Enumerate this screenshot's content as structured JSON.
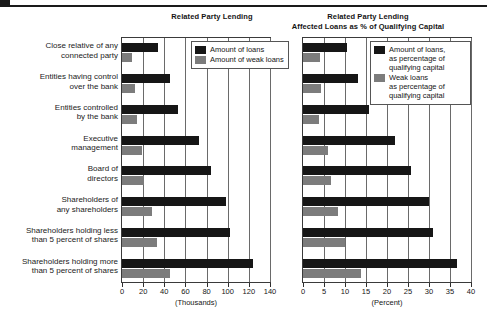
{
  "chart_data": [
    {
      "id": "left",
      "type": "bar",
      "orientation": "horizontal",
      "title": "Related Party Lending",
      "xlabel": "(Thousands)",
      "ylabel": "",
      "xlim": [
        0,
        140
      ],
      "xticks": [
        0,
        20,
        40,
        60,
        80,
        100,
        120,
        140
      ],
      "grid": true,
      "legend_position": "top-right",
      "categories": [
        "Close relative of any\nconnected party",
        "Entities having control\nover the bank",
        "Entities controlled\nby the bank",
        "Executive\nmanagement",
        "Board of\ndirectors",
        "Shareholders of\nany shareholders",
        "Shareholders holding less\nthan 5 percent of shares",
        "Shareholders holding more\nthan 5 percent of shares"
      ],
      "series": [
        {
          "name": "Amount of loans",
          "color": "#161616",
          "values": [
            34,
            45,
            53,
            73,
            84,
            98,
            102,
            124
          ]
        },
        {
          "name": "Amount of weak loans",
          "color": "#7c7c7c",
          "values": [
            9,
            12,
            14,
            19,
            21,
            28,
            33,
            45
          ]
        }
      ]
    },
    {
      "id": "right",
      "type": "bar",
      "orientation": "horizontal",
      "title": "Related Party Lending\nAffected  Loans as % of Qualifying Capital",
      "xlabel": "(Percent)",
      "ylabel": "",
      "xlim": [
        0,
        40
      ],
      "xticks": [
        0,
        5,
        10,
        15,
        20,
        25,
        30,
        35,
        40
      ],
      "grid": true,
      "legend_position": "top-right",
      "categories": [
        "Close relative of any connected party",
        "Entities having control over the bank",
        "Entities controlled by the bank",
        "Executive management",
        "Board of directors",
        "Shareholders of any shareholders",
        "Shareholders holding less than 5 percent of shares",
        "Shareholders holding more than 5 percent of shares"
      ],
      "series": [
        {
          "name": "Amount of loans,\nas percentage of\nqualifying capital",
          "color": "#161616",
          "values": [
            10.5,
            13.0,
            15.7,
            22.0,
            25.7,
            30.0,
            31.0,
            36.7
          ]
        },
        {
          "name": "Weak loans\nas percentage of\nqualifying capital",
          "color": "#7c7c7c",
          "values": [
            4.0,
            4.3,
            3.8,
            6.0,
            6.7,
            8.3,
            10.0,
            13.8
          ]
        }
      ]
    }
  ],
  "left_chart": {
    "title": "Related Party Lending",
    "axis_unit": "(Thousands)",
    "legend": [
      {
        "label": "Amount of loans",
        "color": "#161616"
      },
      {
        "label": "Amount of weak loans",
        "color": "#7c7c7c"
      }
    ]
  },
  "right_chart": {
    "title_line1": "Related Party Lending",
    "title_line2": "Affected  Loans as % of Qualifying Capital",
    "axis_unit": "(Percent)",
    "legend": [
      {
        "label": "Amount of loans,\nas percentage of\nqualifying capital",
        "color": "#161616"
      },
      {
        "label": "Weak loans\nas percentage of\nqualifying capital",
        "color": "#7c7c7c"
      }
    ]
  },
  "colors": {
    "dark_series": "#161616",
    "light_series": "#7c7c7c",
    "frame": "#3a3a3a",
    "gridline": "#6a6a6a",
    "background": "#ffffff"
  }
}
